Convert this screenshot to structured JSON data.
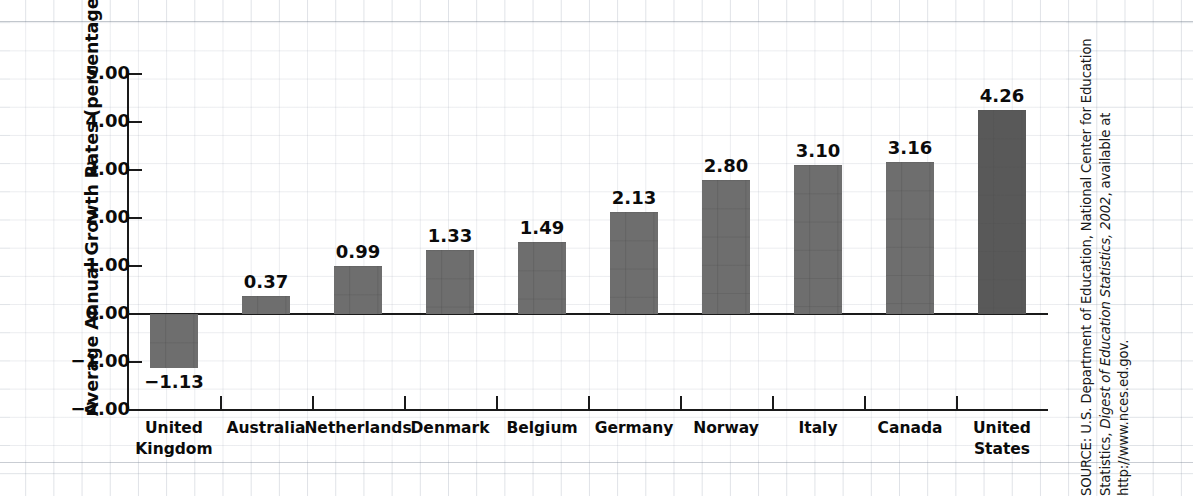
{
  "chart_data": {
    "type": "bar",
    "title": "",
    "xlabel": "",
    "ylabel": "Average Annual Growth Rates (percentage)",
    "ylim": [
      -2.0,
      5.0
    ],
    "ytick_labels": [
      "5.00",
      "4.00",
      "3.00",
      "2.00",
      "1.00",
      "0.00",
      "−1.00",
      "−2.00"
    ],
    "ytick_values": [
      5,
      4,
      3,
      2,
      1,
      0,
      -1,
      -2
    ],
    "grid": true,
    "legend": "none",
    "categories": [
      "United\nKingdom",
      "Australia",
      "Netherlands",
      "Denmark",
      "Belgium",
      "Germany",
      "Norway",
      "Italy",
      "Canada",
      "United\nStates"
    ],
    "values": [
      -1.13,
      0.37,
      0.99,
      1.33,
      1.49,
      2.13,
      2.8,
      3.1,
      3.16,
      4.26
    ],
    "value_labels": [
      "−1.13",
      "0.37",
      "0.99",
      "1.33",
      "1.49",
      "2.13",
      "2.80",
      "3.10",
      "3.16",
      "4.26"
    ],
    "bars": [
      {
        "category_line1": "United",
        "category_line2": "Kingdom",
        "value": -1.13,
        "label": "−1.13",
        "highlight": false
      },
      {
        "category_line1": "Australia",
        "category_line2": "",
        "value": 0.37,
        "label": "0.37",
        "highlight": false
      },
      {
        "category_line1": "Netherlands",
        "category_line2": "",
        "value": 0.99,
        "label": "0.99",
        "highlight": false
      },
      {
        "category_line1": "Denmark",
        "category_line2": "",
        "value": 1.33,
        "label": "1.33",
        "highlight": false
      },
      {
        "category_line1": "Belgium",
        "category_line2": "",
        "value": 1.49,
        "label": "1.49",
        "highlight": false
      },
      {
        "category_line1": "Germany",
        "category_line2": "",
        "value": 2.13,
        "label": "2.13",
        "highlight": false
      },
      {
        "category_line1": "Norway",
        "category_line2": "",
        "value": 2.8,
        "label": "2.80",
        "highlight": false
      },
      {
        "category_line1": "Italy",
        "category_line2": "",
        "value": 3.1,
        "label": "3.10",
        "highlight": false
      },
      {
        "category_line1": "Canada",
        "category_line2": "",
        "value": 3.16,
        "label": "3.16",
        "highlight": false
      },
      {
        "category_line1": "United",
        "category_line2": "States",
        "value": 4.26,
        "label": "4.26",
        "highlight": true
      }
    ],
    "colors": {
      "bar": "#6e6e6e",
      "bar_highlight": "#595959",
      "axis": "#1a1a1a",
      "text": "#0b0b0b",
      "panel_background": "#ffffff",
      "grid": "#a5acb9"
    }
  },
  "source": {
    "prefix": "SOURCE: U.S. Department of Education, National Center for Education Statistics, ",
    "italic": "Digest of Education Statistics, 2002",
    "suffix": ", available at http://www.nces.ed.gov."
  }
}
